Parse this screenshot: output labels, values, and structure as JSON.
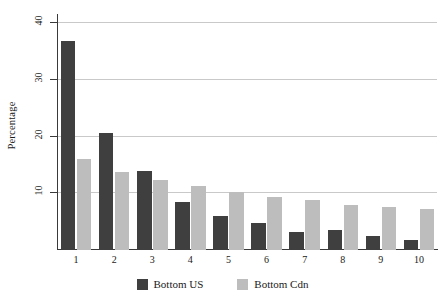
{
  "chart_data": {
    "type": "bar",
    "title": "",
    "xlabel": "",
    "ylabel": "Percentage",
    "categories": [
      "1",
      "2",
      "3",
      "4",
      "5",
      "6",
      "7",
      "8",
      "9",
      "10"
    ],
    "series": [
      {
        "name": "Bottom US",
        "color": "#3f3f3f",
        "values": [
          36.9,
          20.7,
          14.0,
          8.5,
          6.0,
          4.7,
          3.2,
          3.6,
          2.5,
          1.8
        ]
      },
      {
        "name": "Bottom Cdn",
        "color": "#bdbdbd",
        "values": [
          16.0,
          13.8,
          12.3,
          11.3,
          10.2,
          9.3,
          8.8,
          8.0,
          7.6,
          7.2
        ]
      }
    ],
    "ylim": [
      0,
      42
    ],
    "yticks": [
      10,
      20,
      30,
      40
    ],
    "ytick_labels": [
      "10",
      "20",
      "30",
      "40"
    ],
    "grid": "horizontal",
    "legend_position": "bottom"
  },
  "axes": {
    "y_title": "Percentage"
  },
  "legend": {
    "entries": [
      {
        "label": "Bottom US",
        "color": "#3f3f3f"
      },
      {
        "label": "Bottom Cdn",
        "color": "#bdbdbd"
      }
    ]
  },
  "colors": {
    "series_us": "#3f3f3f",
    "series_cdn": "#bdbdbd",
    "gridline": "#c9c9c9",
    "axis": "#3a3a3a",
    "background": "#ffffff"
  }
}
